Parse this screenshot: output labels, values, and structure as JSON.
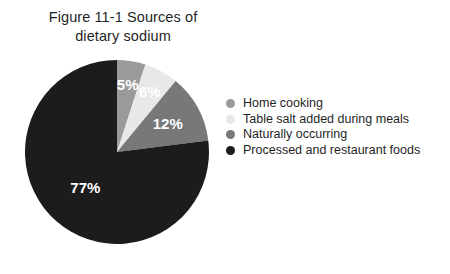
{
  "figure": {
    "title": "Figure 11-1 Sources of\ndietary sodium"
  },
  "chart_data": {
    "type": "pie",
    "title": "Figure 11-1 Sources of dietary sodium",
    "xlabel": "",
    "ylabel": "",
    "unit": "percent",
    "start_angle_deg": 0,
    "direction": "clockwise",
    "legend_position": "right",
    "grid": false,
    "total": 100,
    "categories": [
      "Home cooking",
      "Table salt added during meals",
      "Naturally occurring",
      "Processed and restaurant foods"
    ],
    "values": [
      5,
      6,
      12,
      77
    ],
    "data_labels": [
      "5%",
      "6%",
      "12%",
      "77%"
    ],
    "colors": [
      "#9a9a9a",
      "#e8e8e8",
      "#787878",
      "#1c1c1c"
    ],
    "slices": [
      {
        "label": "Home cooking",
        "value": 5,
        "data_label": "5%",
        "color": "#9a9a9a"
      },
      {
        "label": "Table salt added during meals",
        "value": 6,
        "data_label": "6%",
        "color": "#e8e8e8"
      },
      {
        "label": "Naturally occurring",
        "value": 12,
        "data_label": "12%",
        "color": "#787878"
      },
      {
        "label": "Processed and restaurant foods",
        "value": 77,
        "data_label": "77%",
        "color": "#1c1c1c"
      }
    ]
  },
  "legend": {
    "items": [
      {
        "label": "Home cooking",
        "color": "#9a9a9a"
      },
      {
        "label": "Table salt added during meals",
        "color": "#e8e8e8"
      },
      {
        "label": "Naturally occurring",
        "color": "#787878"
      },
      {
        "label": "Processed and restaurant foods",
        "color": "#1c1c1c"
      }
    ]
  }
}
